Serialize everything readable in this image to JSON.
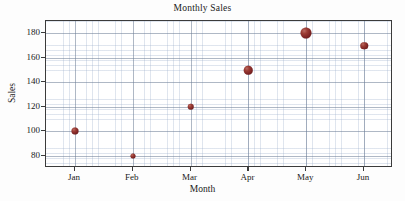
{
  "chart_data": {
    "type": "scatter",
    "title": "Monthly Sales",
    "xlabel": "Month",
    "ylabel": "Sales",
    "categories": [
      "Jan",
      "Feb",
      "Mar",
      "Apr",
      "May",
      "Jun"
    ],
    "values": [
      100,
      80,
      120,
      150,
      180,
      170
    ],
    "series": [
      {
        "name": "Sales",
        "values": [
          100,
          80,
          120,
          150,
          180,
          170
        ],
        "marker_color": "#7d2424",
        "marker_sizes": [
          7,
          5,
          6.5,
          8.5,
          11,
          7.5
        ]
      }
    ],
    "points": [
      {
        "x": "Jan",
        "y": 100,
        "size": 7
      },
      {
        "x": "Feb",
        "y": 80,
        "size": 5
      },
      {
        "x": "Mar",
        "y": 120,
        "size": 6.5
      },
      {
        "x": "Apr",
        "y": 150,
        "size": 8.5
      },
      {
        "x": "May",
        "y": 180,
        "size": 11
      },
      {
        "x": "Jun",
        "y": 170,
        "size": 7.5
      }
    ],
    "ylim": [
      70,
      190
    ],
    "xlim": [
      0.5,
      6.5
    ],
    "yticks": [
      80,
      100,
      120,
      140,
      160,
      180
    ],
    "ytick_labels": [
      "80",
      "100",
      "120",
      "140",
      "160",
      "180"
    ],
    "xticks": [
      1,
      2,
      3,
      4,
      5,
      6
    ],
    "xtick_labels": [
      "Jan",
      "Feb",
      "Mar",
      "Apr",
      "May",
      "Jun"
    ],
    "grid": true,
    "minor_grid": true,
    "legend": false,
    "legend_position": "none",
    "colors": {
      "marker": "#7d2424",
      "marker_highlight": "#b96a62",
      "frame": "#3b3b3b",
      "grid_major": "#6e7d96",
      "grid_minor": "#96aac8",
      "background": "#ffffff",
      "text": "#1a1a1a"
    }
  }
}
